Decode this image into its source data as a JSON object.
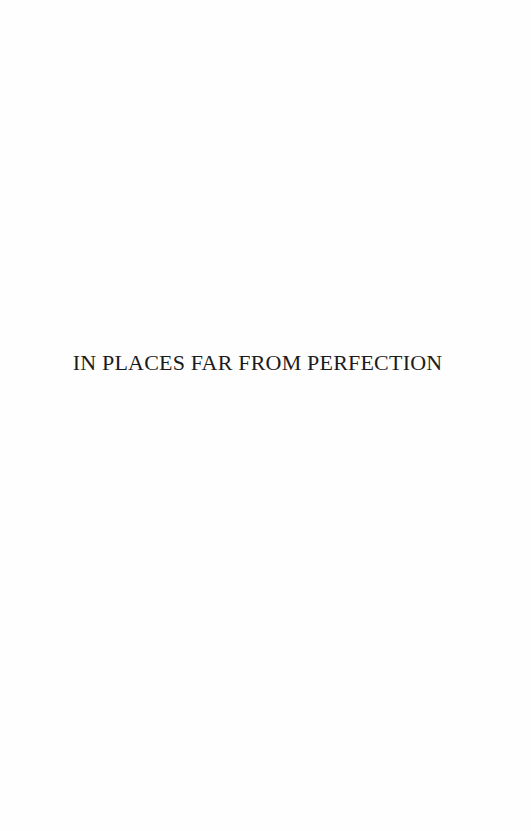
{
  "page": {
    "background_color": "#ffffff",
    "title": "IN PLACES FAR FROM PERFECTION",
    "title_color": "#1c1c1c"
  }
}
